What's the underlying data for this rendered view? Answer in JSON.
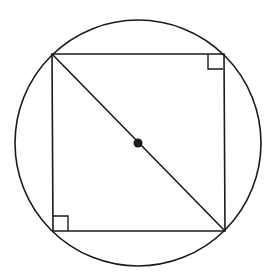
{
  "diagram": {
    "type": "geometry",
    "canvas": {
      "width": 272,
      "height": 279,
      "background": "#ffffff"
    },
    "stroke_color": "#1a1a1a",
    "circle": {
      "cx": 138,
      "cy": 143,
      "r": 123
    },
    "square": {
      "corners": [
        {
          "name": "top-left",
          "x": 52,
          "y": 54
        },
        {
          "name": "top-right",
          "x": 224,
          "y": 54
        },
        {
          "name": "bottom-right",
          "x": 225,
          "y": 231
        },
        {
          "name": "bottom-left",
          "x": 53,
          "y": 231
        }
      ]
    },
    "diagonal": {
      "from": "top-left",
      "to": "bottom-right"
    },
    "center_point": {
      "x": 138,
      "y": 143,
      "r": 4.5
    },
    "right_angle_markers": [
      {
        "corner": "top-right",
        "x": 208,
        "y": 54,
        "size": 15
      },
      {
        "corner": "bottom-left",
        "x": 53,
        "y": 216,
        "size": 15
      }
    ]
  }
}
